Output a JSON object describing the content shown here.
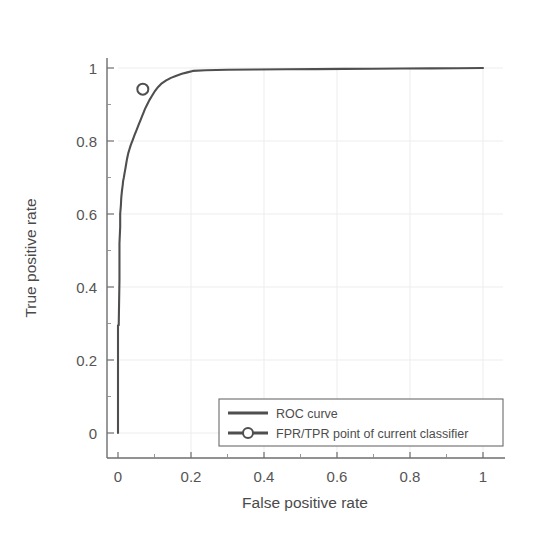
{
  "chart_data": {
    "type": "line",
    "title": "",
    "xlabel": "False positive rate",
    "ylabel": "True positive rate",
    "xlim": [
      -0.04,
      1.05
    ],
    "ylim": [
      -0.05,
      1.05
    ],
    "xticks": [
      "0",
      "0.2",
      "0.4",
      "0.6",
      "0.8",
      "1"
    ],
    "xtick_values": [
      0,
      0.2,
      0.4,
      0.6,
      0.8,
      1
    ],
    "yticks": [
      "0",
      "0.2",
      "0.4",
      "0.6",
      "0.8",
      "1"
    ],
    "ytick_values": [
      0,
      0.2,
      0.4,
      0.6,
      0.8,
      1
    ],
    "grid": true,
    "legend_position": "lower right",
    "series": [
      {
        "name": "ROC curve",
        "style": "line",
        "color": "#4f4f4f",
        "x": [
          0.0,
          0.0,
          0.002,
          0.004,
          0.004,
          0.006,
          0.006,
          0.008,
          0.009,
          0.01,
          0.011,
          0.012,
          0.013,
          0.014,
          0.016,
          0.018,
          0.02,
          0.022,
          0.024,
          0.026,
          0.028,
          0.031,
          0.034,
          0.037,
          0.04,
          0.043,
          0.046,
          0.05,
          0.054,
          0.058,
          0.062,
          0.066,
          0.07,
          0.074,
          0.08,
          0.086,
          0.092,
          0.1,
          0.11,
          0.12,
          0.132,
          0.145,
          0.16,
          0.175,
          0.19,
          0.205,
          0.24,
          0.3,
          0.38,
          0.46,
          0.54,
          0.62,
          0.7,
          0.78,
          0.86,
          0.93,
          1.0
        ],
        "y": [
          0.0,
          0.295,
          0.295,
          0.42,
          0.52,
          0.565,
          0.6,
          0.625,
          0.645,
          0.655,
          0.665,
          0.672,
          0.68,
          0.69,
          0.7,
          0.712,
          0.723,
          0.735,
          0.747,
          0.757,
          0.766,
          0.776,
          0.786,
          0.794,
          0.802,
          0.81,
          0.818,
          0.828,
          0.838,
          0.848,
          0.858,
          0.868,
          0.878,
          0.888,
          0.9,
          0.912,
          0.922,
          0.935,
          0.948,
          0.958,
          0.966,
          0.973,
          0.979,
          0.984,
          0.988,
          0.992,
          0.994,
          0.995,
          0.996,
          0.9965,
          0.997,
          0.9975,
          0.998,
          0.9985,
          0.999,
          0.9995,
          1.0
        ]
      },
      {
        "name": "FPR/TPR point of current classifier",
        "style": "line-marker",
        "color": "#4f4f4f",
        "marker": "circle-open",
        "x": [
          0.068
        ],
        "y": [
          0.942
        ]
      }
    ],
    "annotations": []
  },
  "legend": {
    "entries": [
      {
        "label": "ROC curve",
        "swatch": "line"
      },
      {
        "label": "FPR/TPR point of current classifier",
        "swatch": "line-marker"
      }
    ]
  },
  "axes": {
    "x_title": "False positive rate",
    "y_title": "True positive rate",
    "x_tick_labels": [
      "0",
      "0.2",
      "0.4",
      "0.6",
      "0.8",
      "1"
    ],
    "y_tick_labels": [
      "0",
      "0.2",
      "0.4",
      "0.6",
      "0.8",
      "1"
    ]
  },
  "colors": {
    "curve": "#4f4f4f",
    "axis": "#6e6e6e",
    "grid": "#ededed",
    "background": "#ffffff",
    "text": "#4d4d4d"
  }
}
